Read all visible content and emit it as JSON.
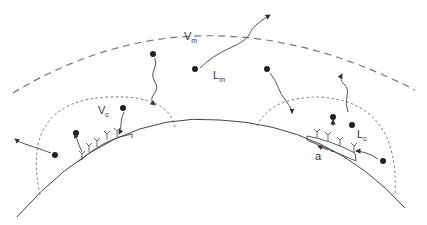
{
  "diagram": {
    "colors": {
      "ink": "#333333",
      "dashed": "#777777",
      "background": "#ffffff"
    },
    "labels": {
      "vm": {
        "main": "V",
        "sub": "m"
      },
      "lm": {
        "main": "L",
        "sub": "m"
      },
      "vc": {
        "main": "V",
        "sub": "c"
      },
      "lc": {
        "main": "L",
        "sub": "c"
      },
      "a": "a"
    },
    "elements": {
      "outer_boundary": "dashed outer volume boundary (V_m)",
      "surface": "solid curved surface",
      "local_volumes": [
        "left dashed local volume (V_c)",
        "right dashed local volume"
      ],
      "receptor_patches": [
        "left receptor patch",
        "right receptor patch with radius a"
      ],
      "particles": 10
    }
  }
}
